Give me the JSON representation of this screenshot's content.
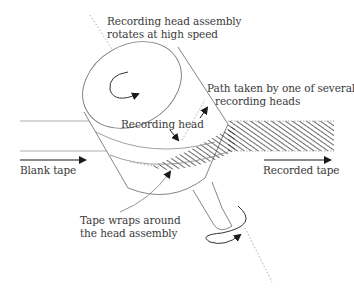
{
  "diagram": {
    "labels": {
      "assembly_line1": "Recording head assembly",
      "assembly_line2": "rotates at high speed",
      "path_line1": "Path taken by one of several",
      "path_line2": "recording heads",
      "recording_head": "Recording head",
      "blank_tape": "Blank tape",
      "recorded_tape": "Recorded tape",
      "wraps_line1": "Tape wraps around",
      "wraps_line2": "the head assembly"
    },
    "colors": {
      "line": "#6e6e6e",
      "dark": "#1a1a1a",
      "hatch": "#2a2a2a",
      "text": "#3a3a3a",
      "background": "#ffffff"
    }
  }
}
